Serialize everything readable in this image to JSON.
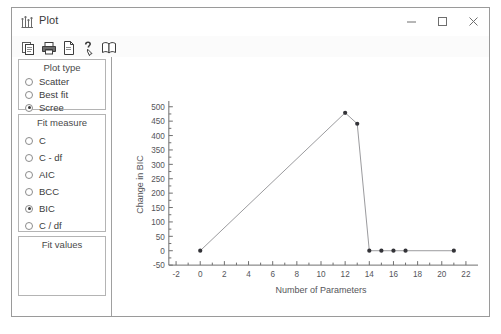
{
  "window": {
    "title": "Plot",
    "icon": "plot-icon",
    "buttons": {
      "minimize": "minimize-icon",
      "maximize": "maximize-icon",
      "close": "close-icon"
    }
  },
  "toolbar": {
    "items": [
      {
        "name": "copy-icon"
      },
      {
        "name": "print-icon"
      },
      {
        "name": "page-setup-icon"
      },
      {
        "name": "help-pointer-icon"
      },
      {
        "name": "book-icon"
      }
    ]
  },
  "plot_type": {
    "title": "Plot type",
    "options": [
      {
        "label": "Scatter",
        "mnemonic": "c",
        "selected": false
      },
      {
        "label": "Best fit",
        "mnemonic": "t",
        "selected": false
      },
      {
        "label": "Scree",
        "mnemonic": "e",
        "selected": true
      }
    ]
  },
  "fit_measure": {
    "title": "Fit measure",
    "options": [
      {
        "label": "C",
        "mnemonic": "C",
        "selected": false
      },
      {
        "label": "C - df",
        "mnemonic": "d",
        "selected": false
      },
      {
        "label": "AIC",
        "mnemonic": "A",
        "selected": false
      },
      {
        "label": "BCC",
        "mnemonic": "B",
        "selected": false
      },
      {
        "label": "BIC",
        "mnemonic": "I",
        "selected": true
      },
      {
        "label": "C / df",
        "mnemonic": "d",
        "selected": false
      }
    ]
  },
  "fit_values": {
    "title": "Fit values",
    "items": []
  },
  "chart_data": {
    "type": "line",
    "title": "",
    "xlabel": "Number of Parameters",
    "ylabel": "Change in BIC",
    "xlim": [
      -3,
      23
    ],
    "ylim": [
      -60,
      520
    ],
    "xticks": [
      -2,
      0,
      2,
      4,
      6,
      8,
      10,
      12,
      14,
      16,
      18,
      20,
      22
    ],
    "xminor": [
      -1,
      1,
      3,
      5,
      7,
      9,
      11,
      13,
      15,
      17,
      19,
      21
    ],
    "yticks": [
      -50,
      0,
      50,
      100,
      150,
      200,
      250,
      300,
      350,
      400,
      450,
      500
    ],
    "grid": false,
    "legend": "none",
    "marker": "filled-circle",
    "series": [
      {
        "name": "Change in BIC",
        "points": [
          {
            "x": 0,
            "y": 0
          },
          {
            "x": 12,
            "y": 479
          },
          {
            "x": 13,
            "y": 441
          },
          {
            "x": 14,
            "y": 0
          },
          {
            "x": 15,
            "y": 0
          },
          {
            "x": 16,
            "y": 0
          },
          {
            "x": 17,
            "y": 0
          },
          {
            "x": 21,
            "y": 0
          }
        ]
      }
    ]
  }
}
